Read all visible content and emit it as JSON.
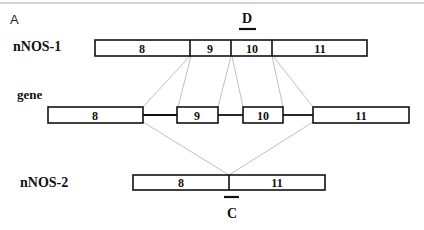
{
  "panel_label": "A",
  "rows": {
    "nnos1": {
      "label": "nNOS-1",
      "exons": [
        "8",
        "9",
        "10",
        "11"
      ]
    },
    "gene": {
      "label": "gene",
      "exons": [
        "8",
        "9",
        "10",
        "11"
      ]
    },
    "nnos2": {
      "label": "nNOS-2",
      "exons": [
        "8",
        "11"
      ]
    }
  },
  "probes": {
    "d": {
      "label": "D",
      "target": "nNOS-1 exon 10"
    },
    "c": {
      "label": "C",
      "target": "nNOS-2 exon 8/11 junction"
    }
  }
}
